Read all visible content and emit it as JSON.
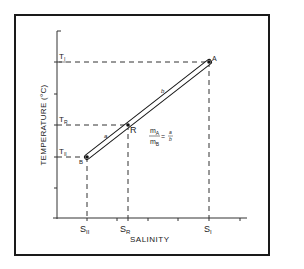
{
  "diagram": {
    "x_axis_label": "SALINITY",
    "y_axis_label": "TEMPERATURE (°C)",
    "points": {
      "A": {
        "label": "A",
        "temp": "T",
        "temp_sub": "I",
        "sal": "S",
        "sal_sub": "I"
      },
      "R": {
        "label": "R",
        "temp": "T",
        "temp_sub": "R",
        "sal": "S",
        "sal_sub": "R"
      },
      "B": {
        "label": "B",
        "temp": "T",
        "temp_sub": "II",
        "sal": "S",
        "sal_sub": "II"
      }
    },
    "segment_labels": {
      "a": "a",
      "b": "b"
    },
    "formula": {
      "numerator_m": "m",
      "numerator_sub": "A",
      "denominator_m": "m",
      "denominator_sub": "B",
      "equals": "=",
      "ratio_num": "a",
      "ratio_den": "b"
    },
    "colors": {
      "line": "#1a1a1a",
      "background": "#ffffff"
    }
  }
}
